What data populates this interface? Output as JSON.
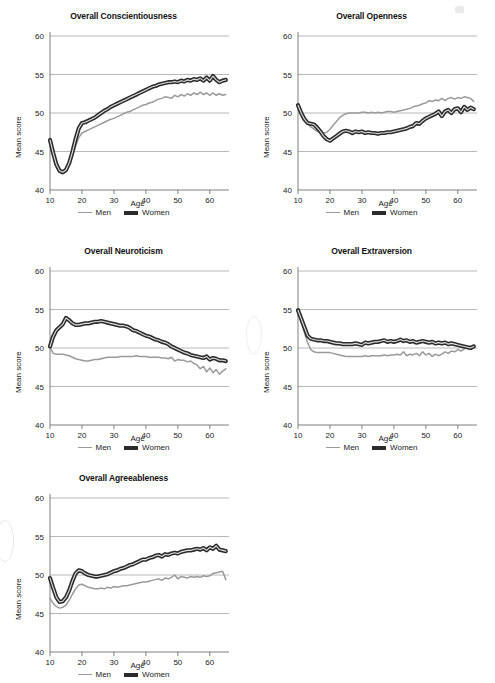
{
  "figure": {
    "shared_xlabel": "Age",
    "shared_ylabel": "Mean score",
    "legend": [
      {
        "key": "men",
        "label": "Men",
        "color": "#9a9a9a",
        "width": 1.6
      },
      {
        "key": "women",
        "label": "Women",
        "color": "#2b2b2b",
        "width": 4
      }
    ]
  },
  "chart_data": [
    {
      "id": "conscientiousness",
      "type": "line",
      "title": "Overall Conscientiousness",
      "xlabel": "Age",
      "ylabel": "Mean score",
      "xlim": [
        10,
        66
      ],
      "ylim": [
        40,
        60
      ],
      "xticks": [
        10,
        20,
        30,
        40,
        50,
        60
      ],
      "yticks": [
        40,
        45,
        50,
        55,
        60
      ],
      "grid": true,
      "x": [
        10,
        11,
        12,
        13,
        14,
        15,
        16,
        17,
        18,
        19,
        20,
        21,
        22,
        23,
        24,
        25,
        26,
        27,
        28,
        29,
        30,
        31,
        32,
        33,
        34,
        35,
        36,
        37,
        38,
        39,
        40,
        41,
        42,
        43,
        44,
        45,
        46,
        47,
        48,
        49,
        50,
        51,
        52,
        53,
        54,
        55,
        56,
        57,
        58,
        59,
        60,
        61,
        62,
        63,
        64,
        65
      ],
      "series": [
        {
          "name": "Men",
          "values": [
            45.9,
            44.3,
            43.0,
            42.4,
            42.3,
            42.6,
            43.3,
            44.4,
            45.7,
            46.8,
            47.4,
            47.6,
            47.8,
            48.0,
            48.2,
            48.4,
            48.6,
            48.8,
            49.0,
            49.2,
            49.3,
            49.5,
            49.7,
            49.9,
            50.1,
            50.2,
            50.4,
            50.6,
            50.8,
            51.0,
            51.1,
            51.3,
            51.4,
            51.6,
            51.8,
            51.9,
            52.1,
            52.0,
            51.9,
            52.3,
            52.1,
            52.4,
            52.2,
            52.5,
            52.3,
            52.6,
            52.4,
            52.7,
            52.4,
            52.6,
            52.3,
            52.6,
            52.3,
            52.5,
            52.3,
            52.4
          ]
        },
        {
          "name": "Women",
          "values": [
            46.5,
            44.8,
            43.3,
            42.5,
            42.3,
            42.6,
            43.5,
            44.9,
            46.6,
            48.0,
            48.7,
            48.8,
            49.0,
            49.2,
            49.4,
            49.7,
            50.0,
            50.3,
            50.5,
            50.8,
            51.0,
            51.2,
            51.4,
            51.6,
            51.8,
            52.0,
            52.2,
            52.4,
            52.6,
            52.8,
            53.0,
            53.2,
            53.4,
            53.5,
            53.7,
            53.8,
            53.9,
            54.0,
            54.0,
            54.1,
            54.0,
            54.2,
            54.1,
            54.3,
            54.2,
            54.4,
            54.3,
            54.5,
            54.2,
            54.6,
            54.2,
            54.8,
            54.3,
            54.0,
            54.2,
            54.3
          ]
        }
      ]
    },
    {
      "id": "openness",
      "type": "line",
      "title": "Overall Openness",
      "xlabel": "Age",
      "ylabel": "Mean score",
      "xlim": [
        10,
        66
      ],
      "ylim": [
        40,
        60
      ],
      "xticks": [
        10,
        20,
        30,
        40,
        50,
        60
      ],
      "yticks": [
        40,
        45,
        50,
        55,
        60
      ],
      "grid": true,
      "x": [
        10,
        11,
        12,
        13,
        14,
        15,
        16,
        17,
        18,
        19,
        20,
        21,
        22,
        23,
        24,
        25,
        26,
        27,
        28,
        29,
        30,
        31,
        32,
        33,
        34,
        35,
        36,
        37,
        38,
        39,
        40,
        41,
        42,
        43,
        44,
        45,
        46,
        47,
        48,
        49,
        50,
        51,
        52,
        53,
        54,
        55,
        56,
        57,
        58,
        59,
        60,
        61,
        62,
        63,
        64,
        65
      ],
      "series": [
        {
          "name": "Men",
          "values": [
            50.6,
            49.9,
            49.1,
            48.6,
            48.2,
            47.9,
            47.6,
            47.5,
            47.4,
            47.5,
            47.9,
            48.4,
            48.9,
            49.4,
            49.7,
            49.9,
            50.0,
            50.0,
            50.0,
            50.0,
            50.1,
            50.1,
            50.0,
            50.1,
            50.0,
            50.1,
            50.0,
            50.1,
            50.2,
            50.2,
            50.1,
            50.2,
            50.3,
            50.4,
            50.5,
            50.6,
            50.8,
            50.9,
            51.0,
            51.2,
            51.3,
            51.6,
            51.5,
            51.7,
            51.6,
            51.9,
            51.6,
            51.9,
            52.0,
            51.8,
            52.0,
            51.9,
            52.1,
            52.0,
            51.9,
            51.5
          ]
        },
        {
          "name": "Women",
          "values": [
            51.0,
            50.0,
            49.2,
            48.7,
            48.6,
            48.5,
            48.1,
            47.6,
            47.0,
            46.6,
            46.4,
            46.7,
            47.0,
            47.3,
            47.6,
            47.7,
            47.6,
            47.4,
            47.6,
            47.5,
            47.6,
            47.4,
            47.5,
            47.4,
            47.4,
            47.3,
            47.4,
            47.4,
            47.5,
            47.5,
            47.6,
            47.7,
            47.8,
            47.9,
            48.0,
            48.2,
            48.3,
            48.7,
            48.6,
            49.0,
            49.3,
            49.5,
            49.7,
            49.9,
            50.2,
            49.6,
            50.2,
            50.4,
            50.0,
            50.5,
            50.6,
            50.1,
            50.8,
            50.4,
            50.7,
            50.5
          ]
        }
      ]
    },
    {
      "id": "neuroticism",
      "type": "line",
      "title": "Overall Neuroticism",
      "xlabel": "Age",
      "ylabel": "Mean score",
      "xlim": [
        10,
        66
      ],
      "ylim": [
        40,
        60
      ],
      "xticks": [
        10,
        20,
        30,
        40,
        50,
        60
      ],
      "yticks": [
        40,
        45,
        50,
        55,
        60
      ],
      "grid": true,
      "x": [
        10,
        11,
        12,
        13,
        14,
        15,
        16,
        17,
        18,
        19,
        20,
        21,
        22,
        23,
        24,
        25,
        26,
        27,
        28,
        29,
        30,
        31,
        32,
        33,
        34,
        35,
        36,
        37,
        38,
        39,
        40,
        41,
        42,
        43,
        44,
        45,
        46,
        47,
        48,
        49,
        50,
        51,
        52,
        53,
        54,
        55,
        56,
        57,
        58,
        59,
        60,
        61,
        62,
        63,
        64,
        65
      ],
      "series": [
        {
          "name": "Men",
          "values": [
            50.1,
            49.3,
            49.2,
            49.2,
            49.2,
            49.1,
            49.0,
            48.8,
            48.6,
            48.5,
            48.4,
            48.3,
            48.3,
            48.4,
            48.5,
            48.5,
            48.6,
            48.7,
            48.8,
            48.8,
            48.8,
            48.8,
            48.9,
            48.9,
            48.9,
            48.9,
            48.9,
            49.0,
            48.9,
            48.9,
            48.9,
            48.8,
            48.8,
            48.8,
            48.8,
            48.7,
            48.7,
            48.6,
            48.8,
            48.3,
            48.5,
            48.4,
            48.4,
            48.2,
            48.3,
            48.0,
            47.8,
            47.3,
            47.6,
            46.9,
            47.4,
            46.8,
            47.2,
            46.6,
            47.0,
            47.3
          ]
        },
        {
          "name": "Women",
          "values": [
            50.2,
            51.5,
            52.3,
            52.7,
            53.1,
            53.9,
            53.6,
            53.2,
            53.0,
            53.0,
            53.1,
            53.2,
            53.2,
            53.3,
            53.4,
            53.4,
            53.5,
            53.4,
            53.3,
            53.2,
            53.1,
            53.0,
            52.9,
            52.9,
            52.8,
            52.6,
            52.3,
            52.2,
            52.0,
            51.8,
            51.6,
            51.5,
            51.3,
            51.1,
            51.0,
            50.8,
            50.7,
            50.5,
            50.2,
            50.0,
            49.8,
            49.6,
            49.4,
            49.3,
            49.1,
            49.0,
            48.9,
            48.8,
            48.7,
            48.9,
            48.5,
            48.7,
            48.6,
            48.4,
            48.4,
            48.3
          ]
        }
      ]
    },
    {
      "id": "extraversion",
      "type": "line",
      "title": "Overall Extraversion",
      "xlabel": "Age",
      "ylabel": "Mean score",
      "xlim": [
        10,
        66
      ],
      "ylim": [
        40,
        60
      ],
      "xticks": [
        10,
        20,
        30,
        40,
        50,
        60
      ],
      "yticks": [
        40,
        45,
        50,
        55,
        60
      ],
      "grid": true,
      "x": [
        10,
        11,
        12,
        13,
        14,
        15,
        16,
        17,
        18,
        19,
        20,
        21,
        22,
        23,
        24,
        25,
        26,
        27,
        28,
        29,
        30,
        31,
        32,
        33,
        34,
        35,
        36,
        37,
        38,
        39,
        40,
        41,
        42,
        43,
        44,
        45,
        46,
        47,
        48,
        49,
        50,
        51,
        52,
        53,
        54,
        55,
        56,
        57,
        58,
        59,
        60,
        61,
        62,
        63,
        64,
        65
      ],
      "series": [
        {
          "name": "Men",
          "values": [
            54.8,
            53.4,
            52.0,
            50.7,
            49.8,
            49.5,
            49.4,
            49.4,
            49.4,
            49.4,
            49.4,
            49.3,
            49.2,
            49.1,
            49.0,
            48.9,
            48.9,
            48.9,
            48.9,
            48.9,
            48.9,
            49.0,
            48.9,
            49.0,
            49.0,
            49.0,
            49.0,
            49.1,
            49.0,
            49.1,
            49.1,
            49.2,
            49.1,
            49.5,
            49.0,
            49.2,
            49.1,
            49.3,
            49.0,
            49.5,
            49.1,
            49.3,
            48.9,
            49.2,
            49.0,
            49.2,
            49.5,
            49.3,
            49.6,
            49.5,
            49.8,
            49.6,
            49.9,
            50.1,
            49.8,
            50.2
          ]
        },
        {
          "name": "Women",
          "values": [
            54.9,
            53.8,
            52.7,
            51.6,
            51.2,
            51.1,
            51.0,
            51.0,
            50.9,
            50.9,
            50.8,
            50.7,
            50.6,
            50.6,
            50.5,
            50.5,
            50.5,
            50.5,
            50.6,
            50.5,
            50.4,
            50.7,
            50.6,
            50.7,
            50.8,
            50.8,
            50.9,
            51.0,
            50.8,
            50.9,
            50.8,
            50.9,
            51.1,
            50.9,
            51.0,
            50.8,
            50.9,
            50.7,
            50.8,
            50.9,
            50.8,
            50.7,
            50.8,
            50.6,
            50.7,
            50.6,
            50.7,
            50.5,
            50.6,
            50.5,
            50.4,
            50.3,
            50.2,
            50.1,
            50.0,
            50.2
          ]
        }
      ]
    },
    {
      "id": "agreeableness",
      "type": "line",
      "title": "Overall Agreeableness",
      "xlabel": "Age",
      "ylabel": "Mean score",
      "xlim": [
        10,
        66
      ],
      "ylim": [
        40,
        60
      ],
      "xticks": [
        10,
        20,
        30,
        40,
        50,
        60
      ],
      "yticks": [
        40,
        45,
        50,
        55,
        60
      ],
      "grid": true,
      "x": [
        10,
        11,
        12,
        13,
        14,
        15,
        16,
        17,
        18,
        19,
        20,
        21,
        22,
        23,
        24,
        25,
        26,
        27,
        28,
        29,
        30,
        31,
        32,
        33,
        34,
        35,
        36,
        37,
        38,
        39,
        40,
        41,
        42,
        43,
        44,
        45,
        46,
        47,
        48,
        49,
        50,
        51,
        52,
        53,
        54,
        55,
        56,
        57,
        58,
        59,
        60,
        61,
        62,
        63,
        64,
        65
      ],
      "series": [
        {
          "name": "Men",
          "values": [
            47.0,
            46.3,
            45.9,
            45.7,
            45.8,
            46.1,
            46.7,
            47.5,
            48.2,
            48.7,
            48.8,
            48.6,
            48.4,
            48.3,
            48.2,
            48.2,
            48.3,
            48.2,
            48.4,
            48.3,
            48.5,
            48.4,
            48.5,
            48.6,
            48.6,
            48.7,
            48.8,
            48.9,
            49.0,
            49.1,
            49.1,
            49.2,
            49.3,
            49.4,
            49.5,
            49.3,
            49.6,
            49.5,
            49.7,
            50.0,
            49.5,
            49.8,
            49.7,
            49.6,
            49.8,
            49.7,
            49.8,
            49.7,
            49.9,
            49.8,
            49.9,
            50.2,
            50.3,
            50.4,
            50.5,
            49.4
          ]
        },
        {
          "name": "Women",
          "values": [
            49.6,
            48.3,
            47.1,
            46.5,
            46.6,
            47.1,
            48.0,
            49.2,
            50.2,
            50.6,
            50.5,
            50.2,
            50.0,
            49.9,
            49.8,
            49.8,
            49.9,
            50.0,
            50.1,
            50.3,
            50.5,
            50.6,
            50.8,
            50.9,
            51.1,
            51.3,
            51.4,
            51.6,
            51.8,
            52.0,
            52.0,
            52.2,
            52.3,
            52.5,
            52.6,
            52.4,
            52.7,
            52.6,
            52.8,
            52.9,
            52.8,
            53.0,
            53.1,
            53.2,
            53.2,
            53.3,
            53.4,
            53.3,
            53.5,
            53.2,
            53.6,
            53.4,
            53.8,
            53.3,
            53.2,
            53.1
          ]
        }
      ]
    }
  ]
}
